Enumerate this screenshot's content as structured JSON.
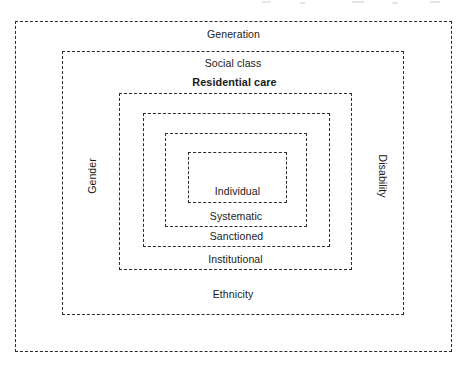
{
  "figure": {
    "type": "nested-rings",
    "background_color": "#ffffff",
    "line_color": "#2b2b2b",
    "text_color": "#1a1a1a",
    "line_style": "dashed",
    "ring_count": 6
  },
  "rings": [
    {
      "level": 1,
      "name": "generation-ring",
      "label": "Generation",
      "label_position": "top-inside",
      "emphasis": false,
      "bounds": {
        "x": 15,
        "y": 21,
        "width": 437,
        "height": 331
      }
    },
    {
      "level": 2,
      "name": "social-class-ring",
      "label": "Social class",
      "label_position": "top-inside",
      "emphasis": false,
      "bounds": {
        "x": 62,
        "y": 51,
        "width": 342,
        "height": 264
      },
      "extra_labels": [
        {
          "name": "ethnicity-label",
          "text": "Ethnicity",
          "position": "bottom-inside"
        },
        {
          "name": "gender-label",
          "text": "Gender",
          "position": "left-inside-rotated"
        },
        {
          "name": "disability-label",
          "text": "Disability",
          "position": "right-inside-rotated"
        }
      ]
    },
    {
      "level": 3,
      "name": "residential-care-ring",
      "label": "Residential care",
      "label_position": "top-outside",
      "emphasis": true,
      "bounds": {
        "x": 119,
        "y": 93,
        "width": 233,
        "height": 177
      },
      "extra_labels": [
        {
          "name": "institutional-label",
          "text": "Institutional",
          "position": "bottom-inside"
        }
      ]
    },
    {
      "level": 4,
      "name": "sanctioned-ring",
      "label": "Sanctioned",
      "label_position": "bottom-inside",
      "emphasis": false,
      "bounds": {
        "x": 143,
        "y": 113,
        "width": 187,
        "height": 134
      }
    },
    {
      "level": 5,
      "name": "systematic-ring",
      "label": "Systematic",
      "label_position": "bottom-inside",
      "emphasis": false,
      "bounds": {
        "x": 165,
        "y": 133,
        "width": 142,
        "height": 94
      }
    },
    {
      "level": 6,
      "name": "individual-ring",
      "label": "Individual",
      "label_position": "bottom-inside",
      "emphasis": false,
      "bounds": {
        "x": 188,
        "y": 152,
        "width": 99,
        "height": 51
      }
    }
  ],
  "labels": {
    "generation": "Generation",
    "social_class": "Social class",
    "residential_care": "Residential care",
    "institutional": "Institutional",
    "sanctioned": "Sanctioned",
    "systematic": "Systematic",
    "individual": "Individual",
    "ethnicity": "Ethnicity",
    "gender": "Gender",
    "disability": "Disability"
  }
}
